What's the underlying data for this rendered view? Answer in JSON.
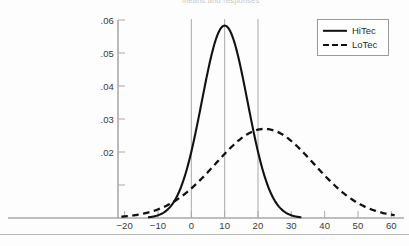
{
  "figure": {
    "top_caption": "means and responses",
    "background_color": "#fdfdfd"
  },
  "legend": {
    "position": "top-right",
    "border_color": "#9a9a9a",
    "entries": [
      {
        "label": "HiTec",
        "style": "solid",
        "color": "#111111"
      },
      {
        "label": "LoTec",
        "style": "dashed",
        "color": "#111111"
      }
    ]
  },
  "axes": {
    "axis_color": "#a9a9a9",
    "reference_line_color": "#a9a9a9",
    "x_ticks": [
      "−20",
      "−10",
      "0",
      "10",
      "20",
      "30",
      "40",
      "50",
      "60"
    ],
    "y_ticks": [
      ".02",
      ".03",
      ".04",
      ".05",
      ".06"
    ]
  },
  "chart_data": {
    "type": "line",
    "title": "",
    "subtitle": "",
    "xlabel": "",
    "ylabel": "",
    "xlim": [
      -22,
      62
    ],
    "ylim": [
      0,
      0.06
    ],
    "grid": false,
    "legend_position": "top-right",
    "x_tick_values": [
      -20,
      -10,
      0,
      10,
      20,
      30,
      40,
      50,
      60
    ],
    "x_tick_labels": [
      "−20",
      "−10",
      "0",
      "10",
      "20",
      "30",
      "40",
      "50",
      "60"
    ],
    "y_tick_values": [
      0.01,
      0.02,
      0.03,
      0.04,
      0.05,
      0.06
    ],
    "y_tick_labels": [
      "",
      ".02",
      ".03",
      ".04",
      ".05",
      ".06"
    ],
    "reference_lines": [
      {
        "orientation": "vertical",
        "x": 0
      },
      {
        "orientation": "vertical",
        "x": 10
      },
      {
        "orientation": "vertical",
        "x": 20
      }
    ],
    "series": [
      {
        "name": "HiTec",
        "style": "solid",
        "color": "#111111",
        "distribution": "normal",
        "mean": 10,
        "sigma": 6.85,
        "peak_value": 0.0583,
        "x_start": -13,
        "x_end": 33,
        "x": [
          -13,
          -10,
          -7,
          -4,
          -1,
          2,
          5,
          8,
          10,
          12,
          15,
          18,
          21,
          24,
          27,
          30,
          33
        ],
        "values": [
          0.0012,
          0.0029,
          0.0063,
          0.0121,
          0.0207,
          0.0316,
          0.0432,
          0.0537,
          0.0583,
          0.0561,
          0.0465,
          0.0336,
          0.0207,
          0.011,
          0.0051,
          0.002,
          0.0007
        ]
      },
      {
        "name": "LoTec",
        "style": "dashed",
        "color": "#111111",
        "distribution": "normal",
        "mean": 22,
        "sigma": 14.8,
        "peak_value": 0.027,
        "x_start": -21,
        "x_end": 61,
        "x": [
          -21,
          -16,
          -11,
          -6,
          -1,
          4,
          9,
          14,
          19,
          22,
          27,
          32,
          37,
          42,
          47,
          52,
          57,
          61
        ],
        "values": [
          0.0029,
          0.0047,
          0.0071,
          0.0101,
          0.0137,
          0.0175,
          0.0211,
          0.0243,
          0.0265,
          0.027,
          0.0261,
          0.0237,
          0.0202,
          0.0162,
          0.0122,
          0.0086,
          0.0057,
          0.0039
        ]
      }
    ]
  }
}
